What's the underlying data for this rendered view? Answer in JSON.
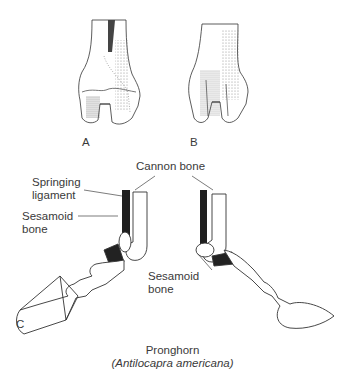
{
  "figure": {
    "panels": {
      "A": {
        "label": "A"
      },
      "B": {
        "label": "B"
      },
      "C": {
        "label": "C"
      }
    },
    "annotations": {
      "cannon_bone": "Cannon bone",
      "springing_ligament_line1": "Springing",
      "springing_ligament_line2": "ligament",
      "sesamoid_left_line1": "Sesamoid",
      "sesamoid_left_line2": "bone",
      "sesamoid_right_line1": "Sesamoid",
      "sesamoid_right_line2": "bone"
    },
    "caption": {
      "common_name": "Pronghorn",
      "scientific_name": "(Antilocapra americana)"
    }
  }
}
